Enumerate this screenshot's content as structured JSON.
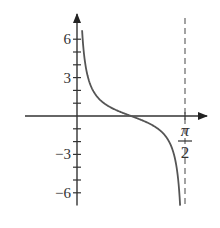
{
  "chart_data": {
    "type": "line",
    "title": "",
    "xlabel": "",
    "ylabel": "",
    "function": "y = cot(2x)",
    "domain": [
      0,
      1.5708
    ],
    "xlim": [
      0,
      1.5708
    ],
    "ylim": [
      -6.5,
      6.5
    ],
    "grid": false,
    "legend": null,
    "x_tick_labels": [
      {
        "value": 1.5708,
        "numerator": "π",
        "denominator": "2"
      }
    ],
    "y_tick_labels": [
      {
        "value": 6,
        "label": "6"
      },
      {
        "value": 3,
        "label": "3"
      },
      {
        "value": -3,
        "label": "−3"
      },
      {
        "value": -6,
        "label": "−6"
      }
    ],
    "y_minor_ticks": [
      -6,
      -5,
      -4,
      -3,
      -2,
      -1,
      1,
      2,
      3,
      4,
      5,
      6
    ],
    "asymptotes": [
      {
        "x": 1.5708,
        "style": "dashed"
      }
    ],
    "x_intercept": 0.7854,
    "series": [
      {
        "name": "cot(2x)",
        "x": [
          0.083,
          0.12,
          0.16,
          0.2,
          0.3,
          0.4,
          0.5,
          0.6,
          0.7854,
          0.9,
          1.0,
          1.1,
          1.2,
          1.3,
          1.4,
          1.45,
          1.49
        ],
        "values": [
          6.0,
          4.1,
          3.0,
          2.4,
          1.46,
          0.97,
          0.64,
          0.39,
          0.0,
          -0.23,
          -0.46,
          -0.73,
          -1.13,
          -1.77,
          -3.4,
          -5.0,
          -6.5
        ]
      }
    ],
    "colors": {
      "curve": "#555555",
      "axes": "#333333",
      "asymptote": "#666666"
    }
  }
}
